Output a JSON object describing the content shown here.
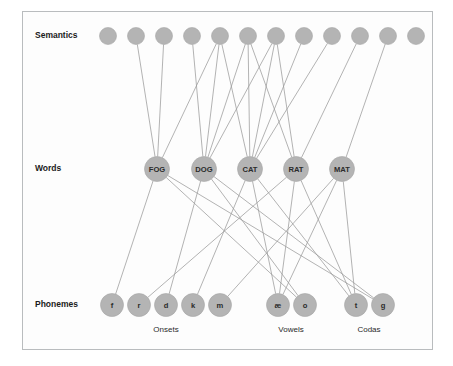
{
  "figure": {
    "background_color": "#ffffff",
    "frame_color": "#b9bcbe",
    "node_fill": "#b4b4b4",
    "node_stroke": "#a6a6a6",
    "edge_color": "#9a9a9a"
  },
  "layers": [
    {
      "id": "semantics",
      "label": "Semantics",
      "label_x": 35,
      "label_y": 36,
      "node_y": 36,
      "node_r": 8.5
    },
    {
      "id": "words",
      "label": "Words",
      "label_x": 35,
      "label_y": 169,
      "node_y": 169,
      "node_r": 12.5
    },
    {
      "id": "phonemes",
      "label": "Phonemes",
      "label_x": 35,
      "label_y": 305,
      "node_y": 305,
      "node_r": 11.5
    }
  ],
  "semantic_nodes": [
    {
      "id": "s1",
      "label": "",
      "x": 108,
      "y": 36
    },
    {
      "id": "s2",
      "label": "",
      "x": 136,
      "y": 36
    },
    {
      "id": "s3",
      "label": "",
      "x": 164,
      "y": 36
    },
    {
      "id": "s4",
      "label": "",
      "x": 192,
      "y": 36
    },
    {
      "id": "s5",
      "label": "",
      "x": 220,
      "y": 36
    },
    {
      "id": "s6",
      "label": "",
      "x": 248,
      "y": 36
    },
    {
      "id": "s7",
      "label": "",
      "x": 276,
      "y": 36
    },
    {
      "id": "s8",
      "label": "",
      "x": 304,
      "y": 36
    },
    {
      "id": "s9",
      "label": "",
      "x": 332,
      "y": 36
    },
    {
      "id": "s10",
      "label": "",
      "x": 360,
      "y": 36
    },
    {
      "id": "s11",
      "label": "",
      "x": 388,
      "y": 36
    },
    {
      "id": "s12",
      "label": "",
      "x": 416,
      "y": 36
    }
  ],
  "word_nodes": [
    {
      "id": "FOG",
      "label": "FOG",
      "x": 157,
      "y": 169
    },
    {
      "id": "DOG",
      "label": "DOG",
      "x": 204,
      "y": 169
    },
    {
      "id": "CAT",
      "label": "CAT",
      "x": 250,
      "y": 169
    },
    {
      "id": "RAT",
      "label": "RAT",
      "x": 296,
      "y": 169
    },
    {
      "id": "MAT",
      "label": "MAT",
      "x": 342,
      "y": 169
    }
  ],
  "phoneme_nodes": [
    {
      "id": "f",
      "label": "f",
      "x": 112,
      "y": 305,
      "group": "Onsets"
    },
    {
      "id": "r",
      "label": "r",
      "x": 139,
      "y": 305,
      "group": "Onsets"
    },
    {
      "id": "d",
      "label": "d",
      "x": 166,
      "y": 305,
      "group": "Onsets"
    },
    {
      "id": "k",
      "label": "k",
      "x": 193,
      "y": 305,
      "group": "Onsets"
    },
    {
      "id": "m",
      "label": "m",
      "x": 220,
      "y": 305,
      "group": "Onsets"
    },
    {
      "id": "ae",
      "label": "æ",
      "x": 278,
      "y": 305,
      "group": "Vowels"
    },
    {
      "id": "o",
      "label": "o",
      "x": 305,
      "y": 305,
      "group": "Vowels"
    },
    {
      "id": "t",
      "label": "t",
      "x": 356,
      "y": 305,
      "group": "Codas"
    },
    {
      "id": "g",
      "label": "g",
      "x": 383,
      "y": 305,
      "group": "Codas"
    }
  ],
  "group_labels": [
    {
      "id": "onsets",
      "label": "Onsets",
      "x": 166,
      "y": 330
    },
    {
      "id": "vowels",
      "label": "Vowels",
      "x": 291,
      "y": 330
    },
    {
      "id": "codas",
      "label": "Codas",
      "x": 369,
      "y": 330
    }
  ],
  "semantics_to_words_edges": [
    {
      "from": "s2",
      "to": "FOG"
    },
    {
      "from": "s3",
      "to": "FOG"
    },
    {
      "from": "s4",
      "to": "DOG"
    },
    {
      "from": "s5",
      "to": "FOG"
    },
    {
      "from": "s5",
      "to": "DOG"
    },
    {
      "from": "s5",
      "to": "CAT"
    },
    {
      "from": "s6",
      "to": "DOG"
    },
    {
      "from": "s6",
      "to": "CAT"
    },
    {
      "from": "s6",
      "to": "RAT"
    },
    {
      "from": "s7",
      "to": "CAT"
    },
    {
      "from": "s7",
      "to": "DOG"
    },
    {
      "from": "s7",
      "to": "RAT"
    },
    {
      "from": "s8",
      "to": "CAT"
    },
    {
      "from": "s9",
      "to": "CAT"
    },
    {
      "from": "s10",
      "to": "RAT"
    },
    {
      "from": "s11",
      "to": "MAT"
    }
  ],
  "words_to_phonemes_edges": [
    {
      "from": "FOG",
      "to": "f"
    },
    {
      "from": "FOG",
      "to": "o"
    },
    {
      "from": "FOG",
      "to": "g"
    },
    {
      "from": "DOG",
      "to": "d"
    },
    {
      "from": "DOG",
      "to": "o"
    },
    {
      "from": "DOG",
      "to": "g"
    },
    {
      "from": "CAT",
      "to": "k"
    },
    {
      "from": "CAT",
      "to": "ae"
    },
    {
      "from": "CAT",
      "to": "t"
    },
    {
      "from": "RAT",
      "to": "r"
    },
    {
      "from": "RAT",
      "to": "ae"
    },
    {
      "from": "RAT",
      "to": "t"
    },
    {
      "from": "MAT",
      "to": "m"
    },
    {
      "from": "MAT",
      "to": "ae"
    },
    {
      "from": "MAT",
      "to": "t"
    }
  ]
}
